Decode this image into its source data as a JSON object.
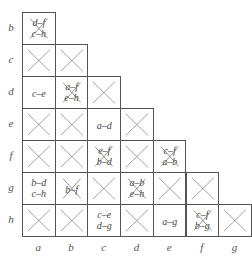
{
  "row_labels": [
    "b",
    "c",
    "d",
    "e",
    "f",
    "g",
    "h"
  ],
  "col_labels": [
    "a",
    "b",
    "c",
    "d",
    "e",
    "f",
    "g"
  ],
  "colors": {
    "line": "#555555",
    "cross": "#777777",
    "text": "#444444",
    "background": "#ffffff"
  },
  "cells": [
    [
      {
        "type": "pairs-crossed",
        "lines": [
          "d–f",
          "c–h"
        ]
      }
    ],
    [
      {
        "type": "cross"
      },
      {
        "type": "cross"
      }
    ],
    [
      {
        "type": "pairs",
        "lines": [
          "c–e"
        ]
      },
      {
        "type": "pairs-crossed",
        "lines": [
          "a–f",
          "e–h"
        ]
      },
      {
        "type": "cross"
      }
    ],
    [
      {
        "type": "cross"
      },
      {
        "type": "cross"
      },
      {
        "type": "pairs",
        "lines": [
          "a–d"
        ]
      },
      {
        "type": "cross"
      }
    ],
    [
      {
        "type": "cross"
      },
      {
        "type": "cross"
      },
      {
        "type": "pairs-crossed",
        "lines": [
          "e–f",
          "b–d"
        ]
      },
      {
        "type": "cross"
      },
      {
        "type": "pairs-crossed",
        "lines": [
          "c–f",
          "a–b"
        ]
      }
    ],
    [
      {
        "type": "pairs",
        "lines": [
          "b–d",
          "c–h"
        ]
      },
      {
        "type": "pairs-crossed",
        "lines": [
          "b–f"
        ]
      },
      {
        "type": "cross"
      },
      {
        "type": "pairs-crossed",
        "lines": [
          "a–b",
          "e–h"
        ]
      },
      {
        "type": "cross"
      },
      {
        "type": "cross"
      }
    ],
    [
      {
        "type": "cross"
      },
      {
        "type": "cross"
      },
      {
        "type": "pairs",
        "lines": [
          "c–e",
          "d–g"
        ]
      },
      {
        "type": "cross"
      },
      {
        "type": "pairs",
        "lines": [
          "a–g"
        ]
      },
      {
        "type": "pairs-crossed",
        "lines": [
          "c–f",
          "b–g"
        ]
      },
      {
        "type": "cross"
      }
    ]
  ]
}
